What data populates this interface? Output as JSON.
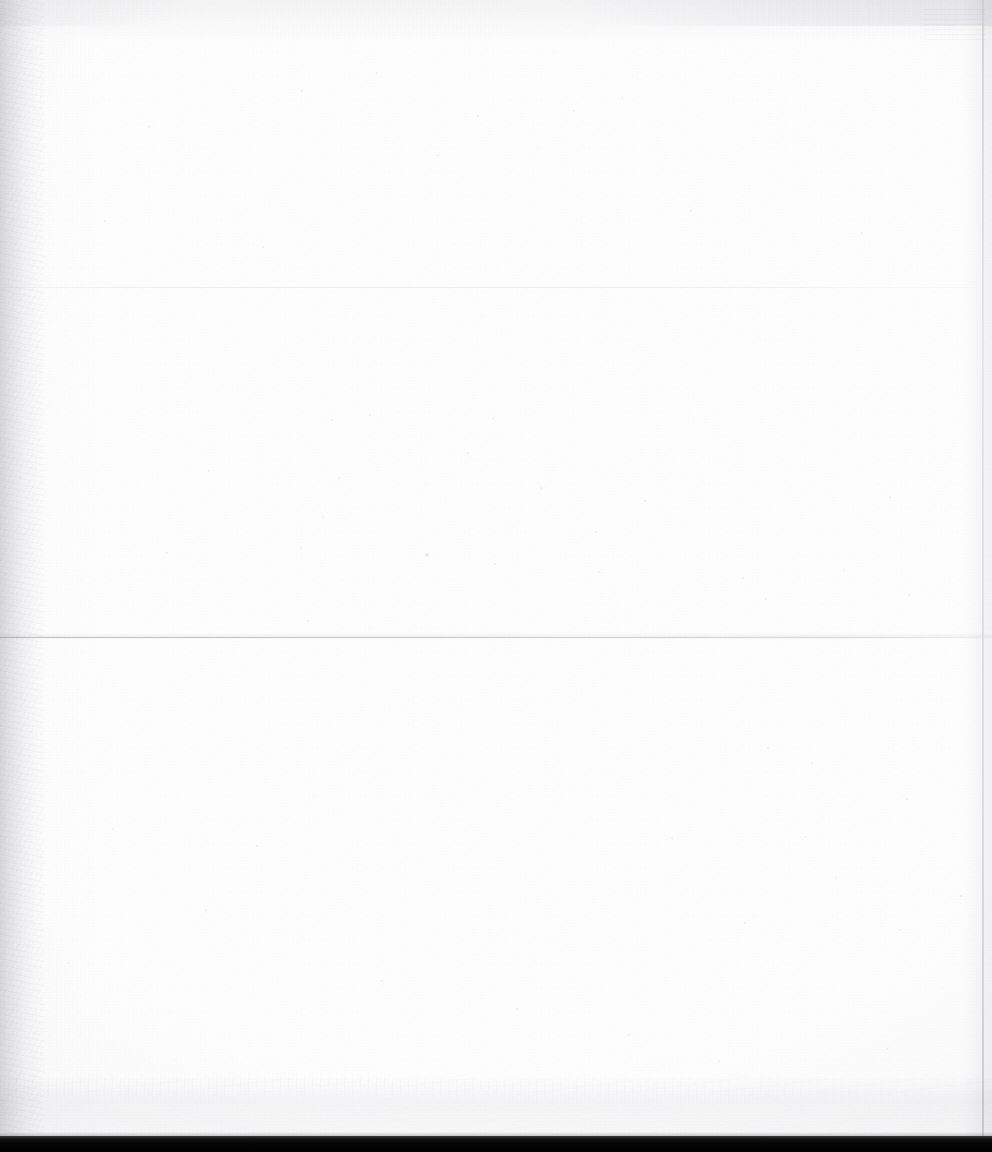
{
  "document": {
    "page_content_text": "",
    "page_state_label": "blank",
    "surface": "scanned paper page"
  },
  "colors": {
    "paper": "#fefefe",
    "paper_shade": "#f1f1f2",
    "gutter_band": "#e2e2e5",
    "crease_line": "#c6c6cb",
    "crease_faint": "#e8e8ec",
    "page_edge": "#cecdd2",
    "scanner_edge": "#000000",
    "dust_speck": "#0000001a"
  },
  "regions": {
    "paper_sheet": {
      "label": "paper-sheet",
      "x": 0,
      "y": 0,
      "width": 992,
      "height": 1137
    },
    "left_gutter": {
      "label": "left-gutter-band",
      "x": 0,
      "y": 0,
      "width": 44,
      "height": 1137
    },
    "right_page_edge": {
      "label": "right-page-edge",
      "x": 982,
      "y": 0,
      "width": 2,
      "height": 1137
    },
    "top_mottle": {
      "label": "top-edge-mottling",
      "x": 0,
      "y": 0,
      "width": 992,
      "height": 26
    },
    "bottom_texture": {
      "label": "bottom-texture-band",
      "x": 0,
      "y": 1078,
      "width": 992,
      "height": 59
    },
    "scanner_edge": {
      "label": "scanner-bed-edge",
      "x": 0,
      "y": 1136,
      "width": 992,
      "height": 16
    }
  },
  "creases": [
    {
      "id": "crease-main",
      "y": 637,
      "width": 992,
      "intensity": "visible"
    },
    {
      "id": "crease-faint",
      "y": 287,
      "width": 992,
      "intensity": "very-faint"
    }
  ],
  "artifacts": [
    {
      "id": "ghost-smudge-top-right",
      "x": 924,
      "y": 6,
      "width": 62,
      "height": 34,
      "description": "faint bleed-through smudge"
    }
  ],
  "dust": [
    {
      "x": 148,
      "y": 126,
      "r": 1
    },
    {
      "x": 301,
      "y": 90,
      "r": 1
    },
    {
      "x": 376,
      "y": 72,
      "r": 1
    },
    {
      "x": 437,
      "y": 154,
      "r": 1
    },
    {
      "x": 477,
      "y": 115,
      "r": 1
    },
    {
      "x": 573,
      "y": 110,
      "r": 1
    },
    {
      "x": 621,
      "y": 97,
      "r": 1
    },
    {
      "x": 104,
      "y": 220,
      "r": 1
    },
    {
      "x": 262,
      "y": 246,
      "r": 1
    },
    {
      "x": 690,
      "y": 210,
      "r": 1
    },
    {
      "x": 861,
      "y": 232,
      "r": 1
    },
    {
      "x": 331,
      "y": 419,
      "r": 1
    },
    {
      "x": 369,
      "y": 414,
      "r": 1
    },
    {
      "x": 492,
      "y": 417,
      "r": 1
    },
    {
      "x": 467,
      "y": 452,
      "r": 1
    },
    {
      "x": 338,
      "y": 477,
      "r": 1
    },
    {
      "x": 322,
      "y": 516,
      "r": 1
    },
    {
      "x": 540,
      "y": 487,
      "r": 1
    },
    {
      "x": 595,
      "y": 531,
      "r": 1
    },
    {
      "x": 425,
      "y": 553,
      "r": 2
    },
    {
      "x": 300,
      "y": 547,
      "r": 1
    },
    {
      "x": 494,
      "y": 563,
      "r": 1
    },
    {
      "x": 644,
      "y": 500,
      "r": 1
    },
    {
      "x": 598,
      "y": 571,
      "r": 1
    },
    {
      "x": 742,
      "y": 577,
      "r": 1
    },
    {
      "x": 843,
      "y": 570,
      "r": 1
    },
    {
      "x": 889,
      "y": 496,
      "r": 1
    },
    {
      "x": 908,
      "y": 594,
      "r": 1
    },
    {
      "x": 765,
      "y": 598,
      "r": 1
    },
    {
      "x": 307,
      "y": 620,
      "r": 1
    },
    {
      "x": 166,
      "y": 552,
      "r": 1
    },
    {
      "x": 208,
      "y": 470,
      "r": 1
    },
    {
      "x": 767,
      "y": 747,
      "r": 1
    },
    {
      "x": 811,
      "y": 762,
      "r": 1
    },
    {
      "x": 671,
      "y": 837,
      "r": 1
    },
    {
      "x": 805,
      "y": 836,
      "r": 1
    },
    {
      "x": 906,
      "y": 798,
      "r": 1
    },
    {
      "x": 835,
      "y": 876,
      "r": 1
    },
    {
      "x": 960,
      "y": 895,
      "r": 1
    },
    {
      "x": 899,
      "y": 929,
      "r": 1
    },
    {
      "x": 744,
      "y": 922,
      "r": 1
    },
    {
      "x": 256,
      "y": 845,
      "r": 1
    },
    {
      "x": 112,
      "y": 828,
      "r": 1
    },
    {
      "x": 205,
      "y": 909,
      "r": 1
    },
    {
      "x": 67,
      "y": 962,
      "r": 1
    },
    {
      "x": 381,
      "y": 980,
      "r": 1
    },
    {
      "x": 516,
      "y": 1008,
      "r": 1
    },
    {
      "x": 628,
      "y": 1034,
      "r": 1
    },
    {
      "x": 718,
      "y": 1060,
      "r": 1
    },
    {
      "x": 886,
      "y": 1048,
      "r": 1
    }
  ]
}
